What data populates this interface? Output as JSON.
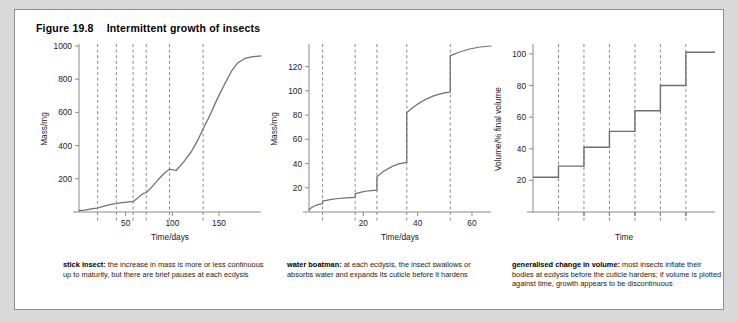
{
  "figure": {
    "number": "Figure 19.8",
    "title": "Intermittent growth of insects"
  },
  "colors": {
    "page_background": "#d9d9d9",
    "card_background": "#ffffff",
    "card_border": "#8d8d8d",
    "axis": "#8a8a8a",
    "curve": "#6f6f6f",
    "dash": "#8a8a8a",
    "text": "#1a1a1a"
  },
  "panels": [
    {
      "id": "stick-insect",
      "caption_lead": "stick insect:",
      "caption_body": " the increase in mass is more or less continuous up to maturity, but there are brief pauses at each ecdysis"
    },
    {
      "id": "water-boatman",
      "caption_lead": "water boatman:",
      "caption_body": " at each ecdysis, the insect swallows or absorbs water and expands its cuticle before it hardens"
    },
    {
      "id": "generalised-change-in-volume",
      "caption_lead": "generalised change in volume:",
      "caption_body": " most insects inflate their bodies at ecdysis before the cuticle hardens; if volume is plotted against time, growth appears to be discontinuous"
    }
  ],
  "chart_data": [
    {
      "type": "line",
      "id": "stick-insect-chart",
      "title": "stick insect",
      "xlabel": "Time/days",
      "ylabel": "Mass/mg",
      "xlim": [
        0,
        195
      ],
      "ylim": [
        0,
        1000
      ],
      "xticks": [
        50,
        100,
        150
      ],
      "xtick_labels": [
        "50",
        "100",
        "150"
      ],
      "yticks": [
        200,
        400,
        600,
        800,
        1000
      ],
      "ytick_labels": [
        "200",
        "400",
        "600",
        "800",
        "1000"
      ],
      "grid": false,
      "legend": "none",
      "ecdysis_days": [
        20,
        40,
        58,
        72,
        97,
        133
      ],
      "annotation": "dashed vertical lines mark ecdysis; curve pauses briefly at each",
      "x": [
        0,
        6,
        12,
        16,
        20,
        26,
        31,
        36,
        40,
        46,
        51,
        55,
        58,
        63,
        67,
        70,
        72,
        78,
        85,
        91,
        97,
        104,
        112,
        120,
        127,
        133,
        140,
        148,
        156,
        163,
        170,
        178,
        186,
        195
      ],
      "y": [
        8,
        12,
        18,
        22,
        24,
        34,
        42,
        48,
        50,
        56,
        60,
        62,
        63,
        85,
        104,
        114,
        116,
        150,
        196,
        232,
        258,
        250,
        300,
        360,
        430,
        500,
        580,
        680,
        770,
        845,
        898,
        926,
        936,
        940
      ]
    },
    {
      "type": "line",
      "id": "water-boatman-chart",
      "title": "water boatman",
      "xlabel": "Time/days",
      "ylabel": "Mass/mg",
      "xlim": [
        0,
        67
      ],
      "ylim": [
        0,
        137
      ],
      "xticks": [
        20,
        40,
        60
      ],
      "xtick_labels": [
        "20",
        "40",
        "60"
      ],
      "yticks": [
        20,
        40,
        60,
        80,
        100,
        120
      ],
      "ytick_labels": [
        "20",
        "40",
        "60",
        "80",
        "100",
        "120"
      ],
      "grid": false,
      "legend": "none",
      "ecdysis_days": [
        5,
        17,
        25,
        36,
        52
      ],
      "annotation": "vertical jumps at each ecdysis as the insect takes in water",
      "steps": [
        {
          "x_start": 0,
          "x_end": 5,
          "y_start": 2,
          "y_end": 7
        },
        {
          "jump_at": 5,
          "from": 7,
          "to": 9
        },
        {
          "x_start": 5,
          "x_end": 17,
          "y_start": 9,
          "y_end": 12
        },
        {
          "jump_at": 17,
          "from": 12,
          "to": 15
        },
        {
          "x_start": 17,
          "x_end": 25,
          "y_start": 15,
          "y_end": 18
        },
        {
          "jump_at": 25,
          "from": 18,
          "to": 29
        },
        {
          "x_start": 25,
          "x_end": 36,
          "y_start": 29,
          "y_end": 41
        },
        {
          "jump_at": 36,
          "from": 41,
          "to": 82
        },
        {
          "x_start": 36,
          "x_end": 52,
          "y_start": 82,
          "y_end": 99
        },
        {
          "jump_at": 52,
          "from": 99,
          "to": 129
        },
        {
          "x_start": 52,
          "x_end": 67,
          "y_start": 129,
          "y_end": 137
        }
      ]
    },
    {
      "type": "line",
      "id": "generalised-volume-chart",
      "title": "generalised change in volume",
      "xlabel": "Time",
      "ylabel": "Volume/% final volume",
      "xlim": [
        0,
        100
      ],
      "ylim": [
        0,
        105
      ],
      "xticks": [
        14,
        28,
        42,
        56,
        70,
        84
      ],
      "xtick_labels": [
        "",
        "",
        "",
        "",
        "",
        ""
      ],
      "yticks": [
        20,
        40,
        60,
        80,
        100
      ],
      "ytick_labels": [
        "20",
        "40",
        "60",
        "80",
        "100"
      ],
      "grid": false,
      "legend": "none",
      "annotation": "staircase: each riser is an ecdysis, each tread a stadium",
      "step_levels": [
        22,
        29,
        41,
        51,
        64,
        80,
        101
      ],
      "step_edges": [
        0,
        14,
        28,
        42,
        56,
        70,
        84,
        100
      ]
    }
  ]
}
